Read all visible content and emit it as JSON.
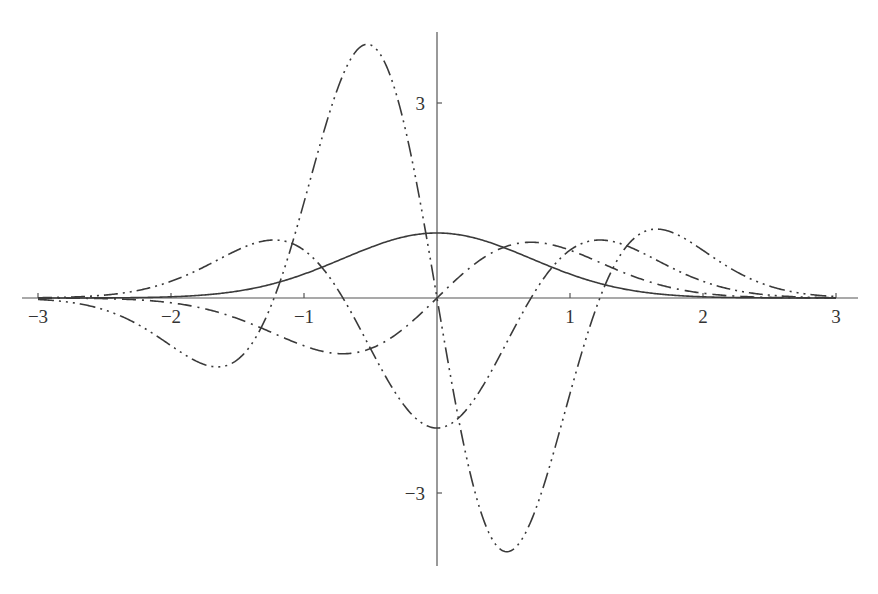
{
  "chart_data": {
    "type": "line",
    "title": "",
    "xlabel": "",
    "ylabel": "",
    "xlim": [
      -3.15,
      3.15
    ],
    "ylim": [
      -4.1,
      4.2
    ],
    "grid": false,
    "legend": null,
    "x_ticks": [
      -3,
      -2,
      -1,
      1,
      2,
      3
    ],
    "x_tick_labels": [
      "−3",
      "−2",
      "−1",
      "1",
      "2",
      "3"
    ],
    "y_ticks": [
      3,
      -3
    ],
    "y_tick_labels": [
      "3",
      "−3"
    ],
    "series": [
      {
        "name": "H0(x)·e^(-x²)",
        "style": "solid",
        "dash": "",
        "formula": "exp(-x^2)",
        "peak": {
          "x": 0,
          "y": 1.0
        }
      },
      {
        "name": "H1(x)·e^(-x²)",
        "style": "dash-dot",
        "dash": "14 6 2 6",
        "formula": "2x·exp(-x^2)",
        "extrema": [
          {
            "x": -0.71,
            "y": -0.86
          },
          {
            "x": 0.71,
            "y": 0.86
          }
        ]
      },
      {
        "name": "H2(x)·e^(-x²)",
        "style": "dash-dot-dot",
        "dash": "14 5 2 5 2 5",
        "formula": "(4x^2-2)·exp(-x^2)",
        "extrema": [
          {
            "x": -1.22,
            "y": 0.89
          },
          {
            "x": 0,
            "y": -2.0
          },
          {
            "x": 1.22,
            "y": 0.89
          }
        ]
      },
      {
        "name": "H3(x)·e^(-x²)",
        "style": "dash-dot-dot-dot",
        "dash": "16 5 2 5 2 5 2 5",
        "formula": "(8x^3-12x)·exp(-x^2)",
        "extrema": [
          {
            "x": -1.6,
            "y": -1.1
          },
          {
            "x": -0.52,
            "y": 3.9
          },
          {
            "x": 0.52,
            "y": -3.9
          },
          {
            "x": 1.6,
            "y": 1.1
          }
        ]
      }
    ]
  },
  "layout": {
    "origin_px": [
      437,
      298
    ],
    "px_per_unit_x": 133.0,
    "px_per_unit_y": 65.0,
    "x_axis_px": [
      22,
      858
    ],
    "y_axis_px": [
      32,
      566
    ],
    "line_color": "#3a3a3a",
    "axis_color": "#555555"
  }
}
